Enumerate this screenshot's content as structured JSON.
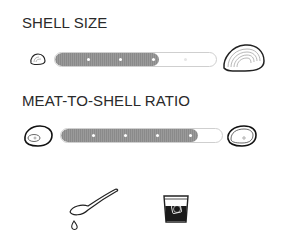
{
  "sections": {
    "shell_size": {
      "title": "SHELL SIZE",
      "min_icon": "small-oyster-shell-icon",
      "max_icon": "large-oyster-shell-icon",
      "level": 3,
      "steps": 5
    },
    "meat_ratio": {
      "title": "MEAT-TO-SHELL RATIO",
      "min_icon": "low-meat-oyster-icon",
      "max_icon": "high-meat-oyster-icon",
      "level": 4,
      "steps": 5
    }
  },
  "flavor_icons": [
    "spoon-drip-icon",
    "whiskey-glass-icon"
  ],
  "colors": {
    "fill": "#8f8f8f",
    "track_border": "#cfcfcf",
    "ink": "#222222"
  }
}
